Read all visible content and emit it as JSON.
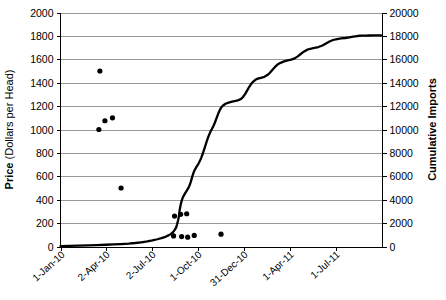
{
  "chart_data": {
    "type": "line",
    "title": "",
    "xlabel": "",
    "ylabel": "Price  (Dollars per Head)",
    "ylabel_bold_part": "Price",
    "ylabel_rest": " (Dollars per Head)",
    "y2label": "Cumulative Imports",
    "ylim": [
      0,
      2000
    ],
    "y2lim": [
      0,
      20000
    ],
    "xlim": [
      "1-Jan-10",
      "1-Oct-11"
    ],
    "grid": true,
    "legend": "none",
    "y_ticks": [
      0,
      200,
      400,
      600,
      800,
      1000,
      1200,
      1400,
      1600,
      1800,
      2000
    ],
    "y2_ticks": [
      0,
      2000,
      4000,
      6000,
      8000,
      10000,
      12000,
      14000,
      16000,
      18000,
      20000
    ],
    "x_ticks": [
      "1-Jan-10",
      "2-Apr-10",
      "2-Jul-10",
      "1-Oct-10",
      "31-Dec-10",
      "1-Apr-11",
      "1-Jul-11"
    ],
    "x_tick_days": [
      0,
      91,
      182,
      273,
      364,
      455,
      546
    ],
    "x_axis_days_max": 638,
    "series": [
      {
        "name": "Cumulative Imports",
        "axis": "right",
        "style": "line",
        "points": [
          [
            0,
            40
          ],
          [
            18,
            60
          ],
          [
            36,
            80
          ],
          [
            55,
            100
          ],
          [
            72,
            120
          ],
          [
            90,
            150
          ],
          [
            105,
            180
          ],
          [
            120,
            210
          ],
          [
            135,
            250
          ],
          [
            148,
            300
          ],
          [
            160,
            360
          ],
          [
            172,
            430
          ],
          [
            182,
            520
          ],
          [
            192,
            620
          ],
          [
            200,
            720
          ],
          [
            208,
            830
          ],
          [
            214,
            950
          ],
          [
            219,
            1080
          ],
          [
            223,
            1230
          ],
          [
            226,
            1400
          ],
          [
            229,
            1620
          ],
          [
            231,
            1900
          ],
          [
            233,
            2250
          ],
          [
            235,
            2650
          ],
          [
            236,
            3100
          ],
          [
            238,
            3550
          ],
          [
            240,
            3900
          ],
          [
            242,
            4150
          ],
          [
            244,
            4330
          ],
          [
            246,
            4480
          ],
          [
            248,
            4620
          ],
          [
            250,
            4760
          ],
          [
            252,
            4900
          ],
          [
            254,
            5050
          ],
          [
            256,
            5250
          ],
          [
            258,
            5500
          ],
          [
            260,
            5800
          ],
          [
            262,
            6100
          ],
          [
            264,
            6350
          ],
          [
            266,
            6550
          ],
          [
            268,
            6700
          ],
          [
            270,
            6850
          ],
          [
            273,
            7050
          ],
          [
            276,
            7300
          ],
          [
            279,
            7600
          ],
          [
            282,
            7950
          ],
          [
            285,
            8350
          ],
          [
            288,
            8750
          ],
          [
            291,
            9150
          ],
          [
            294,
            9500
          ],
          [
            297,
            9800
          ],
          [
            300,
            10050
          ],
          [
            303,
            10300
          ],
          [
            306,
            10600
          ],
          [
            309,
            10950
          ],
          [
            312,
            11300
          ],
          [
            315,
            11600
          ],
          [
            318,
            11850
          ],
          [
            322,
            12050
          ],
          [
            327,
            12200
          ],
          [
            333,
            12300
          ],
          [
            340,
            12380
          ],
          [
            347,
            12450
          ],
          [
            353,
            12520
          ],
          [
            358,
            12620
          ],
          [
            362,
            12800
          ],
          [
            366,
            13050
          ],
          [
            370,
            13350
          ],
          [
            374,
            13650
          ],
          [
            378,
            13900
          ],
          [
            382,
            14100
          ],
          [
            386,
            14250
          ],
          [
            391,
            14350
          ],
          [
            397,
            14420
          ],
          [
            404,
            14500
          ],
          [
            410,
            14650
          ],
          [
            415,
            14850
          ],
          [
            420,
            15100
          ],
          [
            425,
            15350
          ],
          [
            430,
            15550
          ],
          [
            436,
            15700
          ],
          [
            443,
            15820
          ],
          [
            450,
            15900
          ],
          [
            457,
            15970
          ],
          [
            464,
            16080
          ],
          [
            470,
            16250
          ],
          [
            476,
            16450
          ],
          [
            482,
            16650
          ],
          [
            488,
            16800
          ],
          [
            495,
            16900
          ],
          [
            503,
            16970
          ],
          [
            511,
            17050
          ],
          [
            519,
            17180
          ],
          [
            526,
            17350
          ],
          [
            533,
            17520
          ],
          [
            540,
            17650
          ],
          [
            548,
            17730
          ],
          [
            556,
            17780
          ],
          [
            564,
            17820
          ],
          [
            572,
            17870
          ],
          [
            580,
            17930
          ],
          [
            588,
            17990
          ],
          [
            596,
            18020
          ],
          [
            604,
            18030
          ],
          [
            612,
            18035
          ],
          [
            620,
            18040
          ],
          [
            628,
            18045
          ],
          [
            636,
            18050
          ]
        ]
      },
      {
        "name": "Price",
        "axis": "left",
        "style": "scatter",
        "points": [
          [
            78,
            1500
          ],
          [
            76,
            1000
          ],
          [
            103,
            1100
          ],
          [
            88,
            1075
          ],
          [
            120,
            500
          ],
          [
            226,
            260
          ],
          [
            238,
            275
          ],
          [
            250,
            280
          ],
          [
            224,
            90
          ],
          [
            240,
            85
          ],
          [
            252,
            80
          ],
          [
            265,
            95
          ],
          [
            318,
            105
          ]
        ]
      }
    ]
  }
}
